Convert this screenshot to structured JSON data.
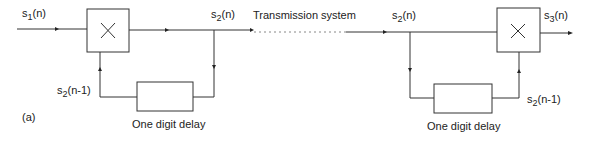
{
  "diagram": {
    "panel_label": "(a)",
    "transmission_label": "Transmission system",
    "encoder": {
      "input_label": {
        "base": "s",
        "sub": "1",
        "arg": "(n)"
      },
      "output_label": {
        "base": "s",
        "sub": "2",
        "arg": "(n)"
      },
      "feedback_label": {
        "base": "s",
        "sub": "2",
        "arg": "(n-1)"
      },
      "multiplier_symbol": "×",
      "delay_label": "One digit delay"
    },
    "decoder": {
      "input_label": {
        "base": "s",
        "sub": "2",
        "arg": "(n)"
      },
      "output_label": {
        "base": "s",
        "sub": "3",
        "arg": "(n)"
      },
      "feedback_label": {
        "base": "s",
        "sub": "2",
        "arg": "(n-1)"
      },
      "multiplier_symbol": "×",
      "delay_label": "One digit delay"
    },
    "colors": {
      "line": "#333333",
      "dotted": "#888888",
      "text": "#222222"
    }
  }
}
